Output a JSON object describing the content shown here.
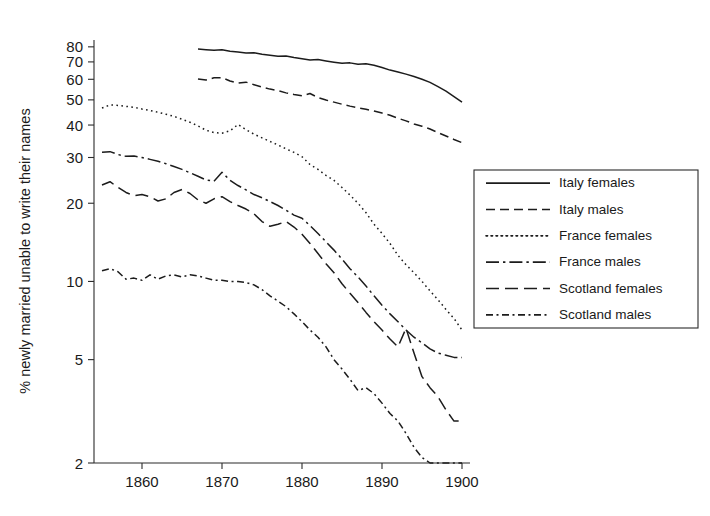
{
  "chart_data": {
    "type": "line",
    "title": "",
    "xlabel": "",
    "ylabel": "% newly married unable to write their names",
    "xlim": [
      1854,
      1901
    ],
    "ylim": [
      2,
      85
    ],
    "yscale": "log",
    "grid": false,
    "legend_position": "right",
    "xticks": [
      1860,
      1870,
      1880,
      1890,
      1900
    ],
    "xticklabels": [
      "1860",
      "1870",
      "1880",
      "1890",
      "1900"
    ],
    "yticks": [
      2,
      5,
      10,
      20,
      30,
      40,
      50,
      60,
      70,
      80
    ],
    "yticklabels": [
      "2",
      "5",
      "10",
      "20",
      "30",
      "40",
      "50",
      "60",
      "70",
      "80"
    ],
    "series": [
      {
        "name": "Italy females",
        "style": "solid",
        "x": [
          1867,
          1868,
          1869,
          1870,
          1871,
          1872,
          1873,
          1874,
          1875,
          1876,
          1877,
          1878,
          1879,
          1880,
          1881,
          1882,
          1883,
          1884,
          1885,
          1886,
          1887,
          1888,
          1889,
          1890,
          1891,
          1892,
          1893,
          1894,
          1895,
          1896,
          1897,
          1898,
          1899,
          1900
        ],
        "y": [
          78.5,
          78.0,
          77.6,
          77.9,
          77.0,
          76.4,
          75.7,
          75.9,
          74.9,
          74.2,
          73.6,
          73.8,
          72.8,
          72.0,
          71.2,
          71.5,
          70.6,
          69.8,
          69.1,
          69.4,
          68.6,
          68.8,
          68.0,
          66.6,
          65.1,
          64.0,
          62.8,
          61.5,
          60.0,
          58.4,
          56.2,
          54.0,
          51.5,
          49.0
        ]
      },
      {
        "name": "Italy males",
        "style": "dashed",
        "x": [
          1867,
          1868,
          1869,
          1870,
          1871,
          1872,
          1873,
          1874,
          1875,
          1876,
          1877,
          1878,
          1879,
          1880,
          1881,
          1882,
          1883,
          1884,
          1885,
          1886,
          1887,
          1888,
          1889,
          1890,
          1891,
          1892,
          1893,
          1894,
          1895,
          1896,
          1897,
          1898,
          1899,
          1900
        ],
        "y": [
          60.2,
          59.6,
          60.8,
          60.9,
          59.1,
          58.0,
          58.5,
          57.2,
          56.0,
          55.0,
          54.3,
          53.2,
          52.4,
          51.8,
          52.9,
          51.0,
          49.9,
          49.0,
          48.1,
          47.3,
          46.6,
          46.0,
          45.3,
          44.5,
          43.6,
          42.5,
          41.5,
          40.4,
          39.6,
          38.6,
          37.4,
          36.3,
          35.2,
          34.2
        ]
      },
      {
        "name": "France females",
        "style": "dotted",
        "x": [
          1855,
          1856,
          1857,
          1858,
          1859,
          1860,
          1861,
          1862,
          1863,
          1864,
          1865,
          1866,
          1867,
          1868,
          1869,
          1870,
          1871,
          1872,
          1873,
          1874,
          1875,
          1876,
          1877,
          1878,
          1879,
          1880,
          1881,
          1882,
          1883,
          1884,
          1885,
          1886,
          1887,
          1888,
          1889,
          1890,
          1891,
          1892,
          1893,
          1894,
          1895,
          1896,
          1897,
          1898,
          1899,
          1900
        ],
        "y": [
          46.5,
          47.8,
          47.6,
          47.2,
          46.8,
          46.1,
          45.5,
          44.8,
          44.0,
          43.2,
          42.1,
          41.0,
          39.7,
          38.2,
          37.4,
          37.2,
          38.0,
          40.2,
          38.4,
          36.9,
          35.7,
          34.6,
          33.5,
          32.4,
          31.4,
          30.2,
          28.2,
          27.0,
          25.6,
          24.5,
          23.0,
          21.5,
          20.0,
          18.4,
          16.6,
          15.3,
          14.0,
          12.6,
          11.6,
          10.8,
          10.0,
          9.2,
          8.5,
          7.8,
          7.2,
          6.5
        ]
      },
      {
        "name": "France males",
        "style": "dashdot",
        "x": [
          1855,
          1856,
          1857,
          1858,
          1859,
          1860,
          1861,
          1862,
          1863,
          1864,
          1865,
          1866,
          1867,
          1868,
          1869,
          1870,
          1871,
          1872,
          1873,
          1874,
          1875,
          1876,
          1877,
          1878,
          1879,
          1880,
          1881,
          1882,
          1883,
          1884,
          1885,
          1886,
          1887,
          1888,
          1889,
          1890,
          1891,
          1892,
          1893,
          1894,
          1895,
          1896,
          1897,
          1898,
          1899,
          1900
        ],
        "y": [
          31.4,
          31.6,
          30.8,
          30.3,
          30.4,
          30.0,
          29.5,
          29.0,
          28.4,
          27.7,
          27.0,
          26.2,
          25.4,
          24.6,
          24.3,
          26.3,
          24.5,
          23.4,
          22.5,
          21.6,
          21.0,
          20.3,
          19.6,
          18.8,
          18.0,
          17.5,
          16.4,
          15.3,
          14.2,
          13.2,
          12.2,
          11.2,
          10.4,
          9.6,
          8.8,
          8.1,
          7.5,
          7.0,
          6.5,
          6.1,
          5.8,
          5.5,
          5.3,
          5.2,
          5.1,
          5.1
        ]
      },
      {
        "name": "Scotland females",
        "style": "longdash",
        "x": [
          1855,
          1856,
          1857,
          1858,
          1859,
          1860,
          1861,
          1862,
          1863,
          1864,
          1865,
          1866,
          1867,
          1868,
          1869,
          1870,
          1871,
          1872,
          1873,
          1874,
          1875,
          1876,
          1877,
          1878,
          1879,
          1880,
          1881,
          1882,
          1883,
          1884,
          1885,
          1886,
          1887,
          1888,
          1889,
          1890,
          1891,
          1892,
          1893,
          1894,
          1895,
          1896,
          1897,
          1898,
          1899,
          1900
        ],
        "y": [
          23.5,
          24.2,
          23.0,
          22.0,
          21.4,
          21.6,
          21.2,
          20.4,
          20.8,
          22.0,
          22.6,
          21.8,
          20.6,
          20.0,
          20.8,
          21.2,
          20.3,
          19.6,
          19.0,
          18.2,
          17.0,
          16.3,
          16.6,
          17.0,
          16.2,
          15.2,
          14.0,
          12.8,
          11.7,
          10.8,
          9.8,
          9.0,
          8.3,
          7.6,
          7.0,
          6.5,
          6.0,
          5.6,
          6.6,
          5.3,
          4.3,
          3.9,
          3.6,
          3.2,
          2.9,
          2.9
        ]
      },
      {
        "name": "Scotland males",
        "style": "dashdotshort",
        "x": [
          1855,
          1856,
          1857,
          1858,
          1859,
          1860,
          1861,
          1862,
          1863,
          1864,
          1865,
          1866,
          1867,
          1868,
          1869,
          1870,
          1871,
          1872,
          1873,
          1874,
          1875,
          1876,
          1877,
          1878,
          1879,
          1880,
          1881,
          1882,
          1883,
          1884,
          1885,
          1886,
          1887,
          1888,
          1889,
          1890,
          1891,
          1892,
          1893,
          1894,
          1895,
          1896,
          1897,
          1898,
          1899,
          1900
        ],
        "y": [
          11.0,
          11.2,
          10.9,
          10.2,
          10.3,
          10.1,
          10.6,
          10.2,
          10.5,
          10.6,
          10.4,
          10.6,
          10.5,
          10.3,
          10.1,
          10.1,
          10.0,
          10.0,
          9.9,
          9.7,
          9.3,
          8.8,
          8.4,
          8.0,
          7.5,
          7.0,
          6.5,
          6.1,
          5.6,
          5.0,
          4.6,
          4.2,
          3.8,
          3.9,
          3.7,
          3.4,
          3.1,
          2.9,
          2.6,
          2.3,
          2.1,
          2.0,
          2.0,
          2.0,
          2.0,
          2.0
        ]
      }
    ]
  },
  "legend": {
    "items": [
      {
        "label": "Italy females",
        "style": "solid"
      },
      {
        "label": "Italy males",
        "style": "dashed"
      },
      {
        "label": "France females",
        "style": "dotted"
      },
      {
        "label": "France males",
        "style": "dashdot"
      },
      {
        "label": "Scotland females",
        "style": "longdash"
      },
      {
        "label": "Scotland males",
        "style": "dashdotshort"
      }
    ]
  }
}
